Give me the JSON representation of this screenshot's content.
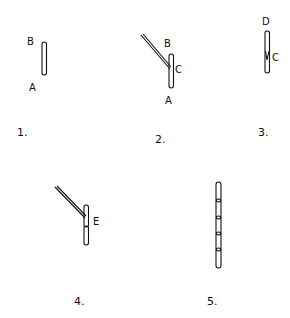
{
  "figure": {
    "title": "",
    "steps": [
      {
        "number": "1.",
        "points": {
          "top": "B",
          "bottom": "A"
        }
      },
      {
        "number": "2.",
        "points": {
          "top": "B",
          "middle": "C",
          "bottom": "A"
        }
      },
      {
        "number": "3.",
        "points": {
          "top": "D",
          "middle": "C"
        }
      },
      {
        "number": "4.",
        "points": {
          "middle": "E"
        }
      },
      {
        "number": "5.",
        "points": {}
      }
    ]
  },
  "colors": {
    "ink": "#111111",
    "background": "#ffffff"
  }
}
